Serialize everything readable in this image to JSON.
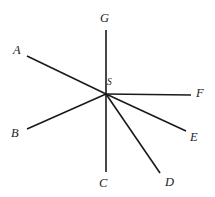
{
  "figure": {
    "name": "rays-from-common-vertex-diagram",
    "background_color": "#ffffff",
    "line_color": "#1a1a1a",
    "label_color": "#1c1c1c",
    "width": 215,
    "height": 197,
    "vertex": {
      "label": "S",
      "x": 106,
      "y": 94,
      "label_x": 107,
      "label_y": 78
    },
    "rays": [
      {
        "label": "A",
        "endpoint_x": 27,
        "endpoint_y": 56,
        "label_x": 13,
        "label_y": 44
      },
      {
        "label": "B",
        "endpoint_x": 27,
        "endpoint_y": 129,
        "label_x": 11,
        "label_y": 127
      },
      {
        "label": "C",
        "endpoint_x": 106,
        "endpoint_y": 172,
        "label_x": 99,
        "label_y": 177
      },
      {
        "label": "D",
        "endpoint_x": 160,
        "endpoint_y": 173,
        "label_x": 165,
        "label_y": 176
      },
      {
        "label": "E",
        "endpoint_x": 186,
        "endpoint_y": 131,
        "label_x": 190,
        "label_y": 131
      },
      {
        "label": "F",
        "endpoint_x": 191,
        "endpoint_y": 95,
        "label_x": 196,
        "label_y": 87
      },
      {
        "label": "G",
        "endpoint_x": 106,
        "endpoint_y": 30,
        "label_x": 100,
        "label_y": 12
      }
    ]
  }
}
